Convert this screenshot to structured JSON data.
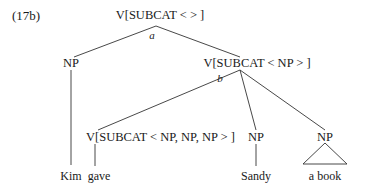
{
  "example_label": "(17b)",
  "tree": {
    "root": {
      "label": "V[SUBCAT < > ]",
      "edge_tag": "a"
    },
    "subject_np": {
      "label": "NP",
      "word": "Kim"
    },
    "vp": {
      "label": "V[SUBCAT < NP > ]",
      "edge_tag": "b"
    },
    "verb": {
      "label": "V[SUBCAT < NP, NP, NP > ]",
      "word": "gave"
    },
    "object1_np": {
      "label": "NP",
      "word": "Sandy"
    },
    "object2_np": {
      "label": "NP",
      "word": "a book",
      "triangle": true
    }
  }
}
